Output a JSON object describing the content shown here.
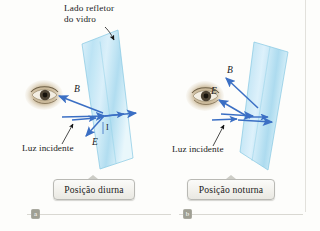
{
  "figure": {
    "caption_title": "Lado refletor\ndo vidro",
    "accent_color": "#3b6fc4",
    "glass_color": "#bfe4f4",
    "eye_color": "#b39a74"
  },
  "panels": [
    {
      "id": "a",
      "badge": "a",
      "caption": "Posição diurna",
      "incident_label": "Luz incidente",
      "ray_b_label": "B",
      "ray_e_label": "E",
      "angle_label": "I"
    },
    {
      "id": "b",
      "badge": "b",
      "caption": "Posição noturna",
      "incident_label": "Luz incidente",
      "ray_b_label": "B",
      "ray_e_label": "E",
      "angle_label": ""
    }
  ]
}
